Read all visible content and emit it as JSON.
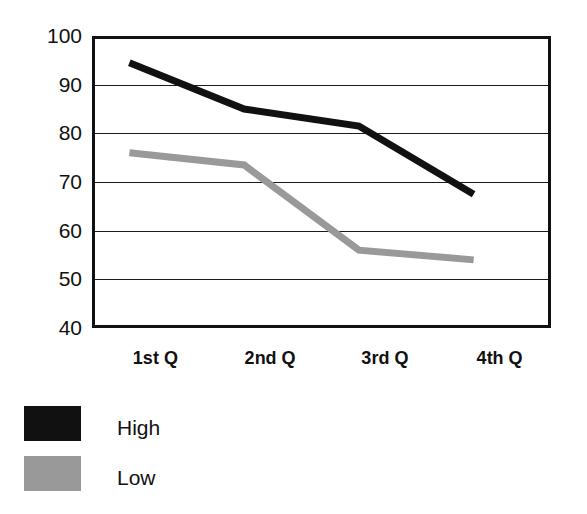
{
  "chart_data": {
    "type": "line",
    "title": "",
    "subtitle": "",
    "xlabel": "",
    "ylabel": "",
    "categories": [
      "1st Q",
      "2nd Q",
      "3rd Q",
      "4th Q"
    ],
    "ylim": [
      40,
      100
    ],
    "yticks": [
      40,
      50,
      60,
      70,
      80,
      90,
      100
    ],
    "ytick_labels": [
      "40",
      "50",
      "60",
      "70",
      "80",
      "90",
      "100"
    ],
    "grid": true,
    "grid_axis": "y",
    "legend_position": "below-left",
    "series": [
      {
        "name": "High",
        "color": "#111111",
        "values": [
          94.5,
          85,
          81.5,
          67.5
        ]
      },
      {
        "name": "Low",
        "color": "#999999",
        "values": [
          76,
          73.5,
          56,
          54
        ]
      }
    ]
  },
  "legend": {
    "items": [
      {
        "label": "High",
        "color": "#111111",
        "swatch": "legend-swatch-high"
      },
      {
        "label": "Low",
        "color": "#999999",
        "swatch": "legend-swatch-low"
      }
    ]
  },
  "colors": {
    "axis": "#111111",
    "grid": "#1a1a1a",
    "background": "#ffffff",
    "series_high": "#111111",
    "series_low": "#999999"
  }
}
